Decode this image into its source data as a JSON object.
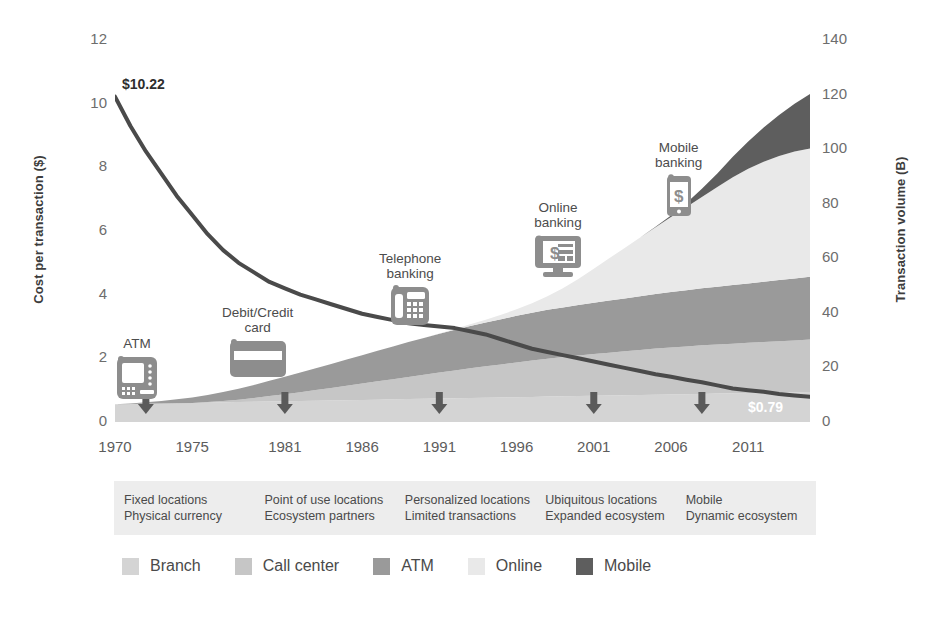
{
  "chart_data": {
    "type": "area",
    "title": "",
    "subtitle": "",
    "xlabel": "",
    "ylabel": "Cost per transaction ($)",
    "y2label": "Transaction volume (B)",
    "xlim": [
      1970,
      2015
    ],
    "ylim": [
      0,
      12
    ],
    "y2lim": [
      0,
      140
    ],
    "grid": false,
    "legend_position": "bottom-left",
    "x_tick_labels": [
      "1970",
      "1975",
      "1981",
      "1986",
      "1991",
      "1996",
      "2001",
      "2006",
      "2011"
    ],
    "x_tick_values": [
      1970,
      1975,
      1981,
      1986,
      1991,
      1996,
      2001,
      2006,
      2011
    ],
    "y_tick_labels": [
      "0",
      "2",
      "4",
      "6",
      "8",
      "10",
      "12"
    ],
    "y_tick_values": [
      0,
      2,
      4,
      6,
      8,
      10,
      12
    ],
    "y2_tick_labels": [
      "0",
      "20",
      "40",
      "60",
      "80",
      "100",
      "120",
      "140"
    ],
    "y2_tick_values": [
      0,
      20,
      40,
      60,
      80,
      100,
      120,
      140
    ],
    "x": [
      1970,
      1971,
      1972,
      1973,
      1974,
      1975,
      1976,
      1977,
      1978,
      1979,
      1980,
      1981,
      1982,
      1983,
      1984,
      1985,
      1986,
      1987,
      1988,
      1989,
      1990,
      1991,
      1992,
      1993,
      1994,
      1995,
      1996,
      1997,
      1998,
      1999,
      2000,
      2001,
      2002,
      2003,
      2004,
      2005,
      2006,
      2007,
      2008,
      2009,
      2010,
      2011,
      2012,
      2013,
      2014,
      2015
    ],
    "series": [
      {
        "name": "Branch",
        "axis": "right",
        "unit": "B",
        "color": "#d4d4d4",
        "values": [
          6.5,
          6.6,
          6.7,
          6.8,
          6.9,
          7.0,
          7.1,
          7.2,
          7.3,
          7.4,
          7.5,
          7.6,
          7.7,
          7.8,
          7.9,
          8.0,
          8.1,
          8.2,
          8.3,
          8.4,
          8.5,
          8.6,
          8.7,
          8.8,
          8.9,
          9.0,
          9.1,
          9.2,
          9.3,
          9.4,
          9.5,
          9.6,
          9.7,
          9.8,
          9.9,
          10.0,
          10.1,
          10.2,
          10.3,
          10.4,
          10.5,
          10.6,
          10.7,
          10.8,
          10.9,
          11.0
        ]
      },
      {
        "name": "Call center",
        "axis": "right",
        "unit": "B",
        "color": "#c6c6c6",
        "values": [
          0.0,
          0.0,
          0.0,
          0.0,
          0.0,
          0.0,
          0.2,
          0.5,
          0.9,
          1.4,
          2.0,
          2.6,
          3.2,
          3.9,
          4.6,
          5.3,
          6.0,
          6.7,
          7.4,
          8.1,
          8.8,
          9.5,
          10.2,
          10.9,
          11.5,
          12.1,
          12.7,
          13.3,
          13.9,
          14.4,
          14.9,
          15.3,
          15.7,
          16.1,
          16.5,
          16.9,
          17.2,
          17.5,
          17.8,
          18.0,
          18.2,
          18.4,
          18.6,
          18.8,
          19.0,
          19.2
        ]
      },
      {
        "name": "ATM",
        "axis": "right",
        "unit": "B",
        "color": "#9a9a9a",
        "values": [
          0.0,
          0.2,
          0.5,
          0.9,
          1.4,
          2.0,
          2.6,
          3.3,
          4.0,
          4.8,
          5.6,
          6.4,
          7.2,
          8.0,
          8.8,
          9.6,
          10.4,
          11.2,
          12.0,
          12.8,
          13.5,
          14.2,
          14.9,
          15.5,
          16.1,
          16.6,
          17.1,
          17.5,
          17.9,
          18.2,
          18.5,
          18.8,
          19.1,
          19.4,
          19.7,
          20.0,
          20.3,
          20.6,
          20.9,
          21.2,
          21.5,
          21.8,
          22.1,
          22.4,
          22.7,
          23.0
        ]
      },
      {
        "name": "Online",
        "axis": "right",
        "unit": "B",
        "color": "#e9e9e9",
        "values": [
          0.0,
          0.0,
          0.0,
          0.0,
          0.0,
          0.0,
          0.0,
          0.0,
          0.0,
          0.0,
          0.0,
          0.0,
          0.0,
          0.0,
          0.0,
          0.0,
          0.0,
          0.0,
          0.0,
          0.0,
          0.0,
          0.1,
          0.3,
          0.6,
          1.0,
          1.6,
          2.4,
          3.5,
          5.0,
          7.0,
          9.5,
          12.5,
          15.5,
          18.5,
          21.5,
          24.5,
          27.5,
          30.5,
          33.5,
          36.5,
          39.5,
          42.0,
          44.0,
          45.5,
          46.5,
          47.0
        ]
      },
      {
        "name": "Mobile",
        "axis": "right",
        "unit": "B",
        "color": "#5e5e5e",
        "values": [
          0.0,
          0.0,
          0.0,
          0.0,
          0.0,
          0.0,
          0.0,
          0.0,
          0.0,
          0.0,
          0.0,
          0.0,
          0.0,
          0.0,
          0.0,
          0.0,
          0.0,
          0.0,
          0.0,
          0.0,
          0.0,
          0.0,
          0.0,
          0.0,
          0.0,
          0.0,
          0.0,
          0.0,
          0.0,
          0.0,
          0.0,
          0.0,
          0.0,
          0.0,
          0.0,
          0.2,
          0.6,
          1.5,
          3.0,
          5.0,
          7.5,
          10.0,
          12.5,
          15.0,
          17.5,
          20.0
        ]
      },
      {
        "name": "Cost per transaction",
        "axis": "left",
        "unit": "$",
        "color": "#4a4a4a",
        "type": "line",
        "values": [
          10.22,
          9.3,
          8.5,
          7.8,
          7.1,
          6.5,
          5.9,
          5.4,
          5.0,
          4.7,
          4.4,
          4.2,
          4.0,
          3.85,
          3.7,
          3.55,
          3.4,
          3.3,
          3.2,
          3.1,
          3.05,
          3.0,
          2.95,
          2.85,
          2.75,
          2.6,
          2.45,
          2.3,
          2.2,
          2.1,
          2.0,
          1.9,
          1.8,
          1.7,
          1.6,
          1.5,
          1.42,
          1.33,
          1.25,
          1.15,
          1.05,
          1.0,
          0.95,
          0.88,
          0.83,
          0.79
        ]
      }
    ],
    "annotations": {
      "start_value": "$10.22",
      "end_value": "$0.79"
    }
  },
  "callouts": [
    {
      "id": "atm",
      "label_line1": "ATM",
      "label_line2": "",
      "icon": "atm-machine-icon"
    },
    {
      "id": "card",
      "label_line1": "Debit/Credit",
      "label_line2": "card",
      "icon": "credit-card-icon"
    },
    {
      "id": "telephone",
      "label_line1": "Telephone",
      "label_line2": "banking",
      "icon": "desk-phone-icon"
    },
    {
      "id": "online",
      "label_line1": "Online",
      "label_line2": "banking",
      "icon": "desktop-monitor-icon"
    },
    {
      "id": "mobile",
      "label_line1": "Mobile",
      "label_line2": "banking",
      "icon": "smartphone-icon"
    }
  ],
  "descriptors": [
    {
      "line1": "Fixed locations",
      "line2": "Physical currency"
    },
    {
      "line1": "Point of use locations",
      "line2": "Ecosystem partners"
    },
    {
      "line1": "Personalized locations",
      "line2": "Limited transactions"
    },
    {
      "line1": "Ubiquitous locations",
      "line2": "Expanded ecosystem"
    },
    {
      "line1": "Mobile",
      "line2": "Dynamic ecosystem"
    }
  ],
  "legend": {
    "items": [
      {
        "label": "Branch",
        "color": "#d4d4d4"
      },
      {
        "label": "Call center",
        "color": "#c6c6c6"
      },
      {
        "label": "ATM",
        "color": "#9a9a9a"
      },
      {
        "label": "Online",
        "color": "#e9e9e9"
      },
      {
        "label": "Mobile",
        "color": "#5e5e5e"
      }
    ]
  },
  "colors": {
    "background": "#ffffff",
    "line": "#4a4a4a",
    "descriptor_strip": "#ededed",
    "text": "#4a4a4a",
    "arrow": "#5a5a5a"
  }
}
